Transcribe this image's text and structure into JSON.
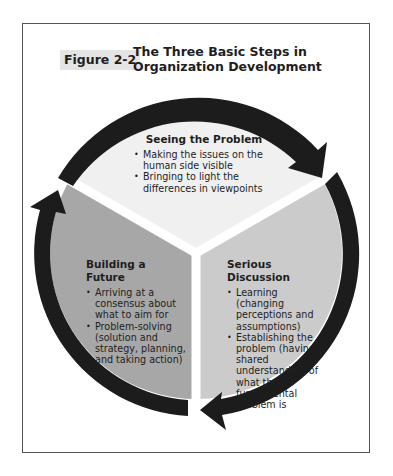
{
  "figure": {
    "label": "Figure 2-2",
    "title": "The Three Basic Steps in Organization Development"
  },
  "segments": [
    {
      "id": "top",
      "heading": "Seeing the Problem",
      "bullets": [
        "Making the issues on the human side visible",
        "Bringing to light the differences in viewpoints"
      ],
      "fill": "#f0f0f0"
    },
    {
      "id": "right",
      "heading": "Serious Discussion",
      "bullets": [
        "Learning (changing perceptions and assumptions)",
        "Establishing the problem (having a shared understanding of what the fundamental problem is"
      ],
      "fill": "#cbcbcb"
    },
    {
      "id": "left",
      "heading": "Building a Future",
      "bullets": [
        "Arriving at a consensus about what to aim for",
        "Problem-solving (solution and strategy, planning, and taking action)"
      ],
      "fill": "#a7a7a7"
    }
  ],
  "arrows": {
    "color": "#1c1c1c",
    "direction": "clockwise",
    "count": 3
  }
}
